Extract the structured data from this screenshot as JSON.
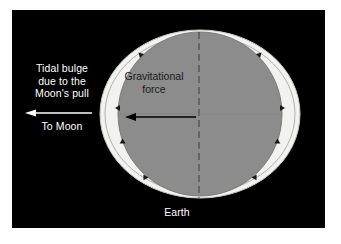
{
  "figure": {
    "background_color": "#ffffff",
    "panel_color": "#000000"
  },
  "colors": {
    "panel_background": "#000000",
    "tidal_bulge_fill": "#f2f2f0",
    "tidal_bulge_outline": "#9a9a96",
    "earth_fill": "#8c8c8c",
    "earth_outline": "#6e6e6e",
    "white_text": "#ffffff",
    "dark_text": "#1a1a1a",
    "arrow_dark": "#000000",
    "arrow_light": "#ffffff",
    "dashed_axis": "#3a3a3a"
  },
  "labels": {
    "tidal_bulge": {
      "line1": "Tidal bulge",
      "line2": "due to the",
      "line3": "Moon's pull"
    },
    "to_moon": "To Moon",
    "gravitational_force": {
      "line1": "Gravitational",
      "line2": "force"
    },
    "earth": "Earth"
  },
  "arrows": [
    {
      "name": "to-moon-arrow",
      "direction": "left",
      "color": "#ffffff",
      "x_start": 80,
      "x_end": 14,
      "y": 103
    },
    {
      "name": "gravitational-force-arrow",
      "direction": "left",
      "color": "#000000",
      "x_start": 184,
      "x_end": 116,
      "y": 107
    }
  ],
  "shapes": {
    "tidal_bulge_ellipse": {
      "center_x": 188,
      "center_y": 104,
      "radius_x": 100,
      "radius_y": 84
    },
    "earth_circle": {
      "center_x": 188,
      "center_y": 104,
      "radius": 82
    },
    "dashed_axis": {
      "x": 187,
      "y_top": 22,
      "y_bottom": 188
    }
  },
  "bulge_markers": {
    "count": 8,
    "description": "small dark arrowheads along the earth circle boundary"
  }
}
